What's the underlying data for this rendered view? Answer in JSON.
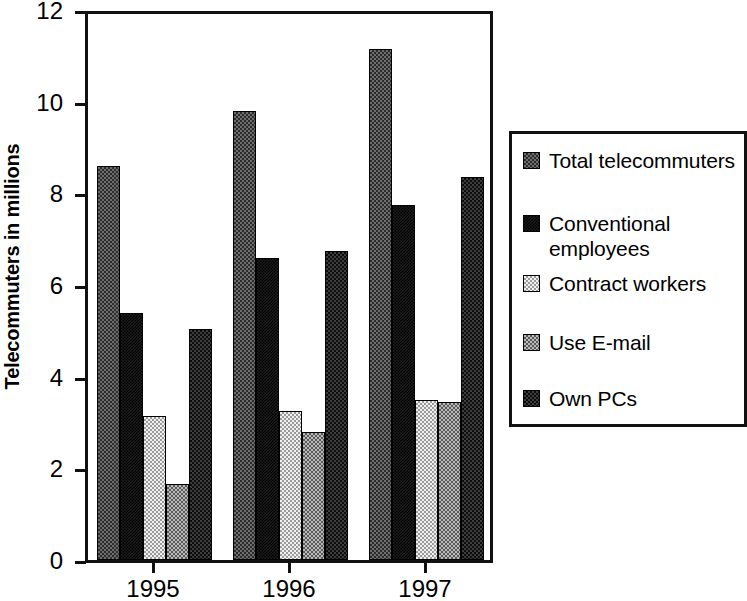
{
  "chart_data": {
    "type": "bar",
    "title": "",
    "subtitle": "",
    "xlabel": "",
    "ylabel": "Telecommuters in millions",
    "categories": [
      "1995",
      "1996",
      "1997"
    ],
    "ylim": [
      0,
      12
    ],
    "yticks": [
      0,
      2,
      4,
      6,
      8,
      10,
      12
    ],
    "ytick_labels": [
      "0",
      "2",
      "4",
      "6",
      "8",
      "10",
      "12"
    ],
    "grid": false,
    "legend_position": "right",
    "series": [
      {
        "name": "Total telecommuters",
        "values": [
          8.6,
          9.8,
          11.15
        ],
        "pattern": "pat-total"
      },
      {
        "name": "Conventional employees",
        "values": [
          5.4,
          6.6,
          7.75
        ],
        "pattern": "pat-conventional"
      },
      {
        "name": "Contract workers",
        "values": [
          3.15,
          3.25,
          3.5
        ],
        "pattern": "pat-contract"
      },
      {
        "name": "Use E-mail",
        "values": [
          1.65,
          2.8,
          3.45
        ],
        "pattern": "pat-email"
      },
      {
        "name": "Own PCs",
        "values": [
          5.05,
          6.75,
          8.35
        ],
        "pattern": "pat-pcs"
      }
    ]
  },
  "axis": {
    "y_title": "Telecommuters in millions"
  },
  "legend": {
    "items": [
      {
        "label": "Total telecommuters",
        "swatch": "pat-total",
        "top": 14,
        "lines": 1
      },
      {
        "label": "Conventional\nemployees",
        "swatch": "pat-conventional",
        "top": 77,
        "lines": 2
      },
      {
        "label": "Contract workers",
        "swatch": "pat-contract",
        "top": 137,
        "lines": 1
      },
      {
        "label": "Use E-mail",
        "swatch": "pat-email",
        "top": 196,
        "lines": 1
      },
      {
        "label": "Own PCs",
        "swatch": "pat-pcs",
        "top": 252,
        "lines": 1
      }
    ]
  }
}
